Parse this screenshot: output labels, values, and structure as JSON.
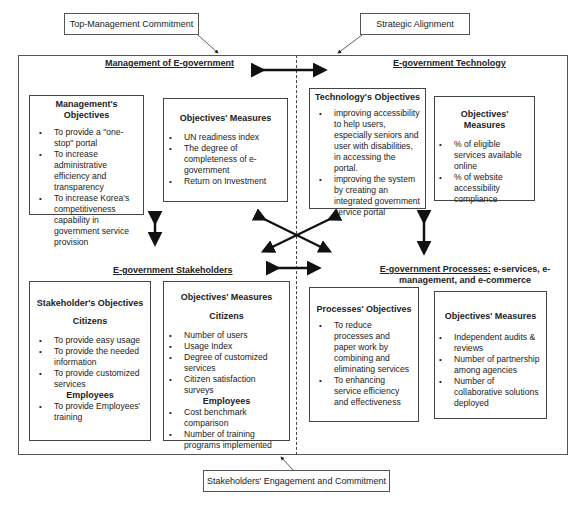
{
  "callouts": {
    "top_left": "Top-Management Commitment",
    "top_right": "Strategic Alignment",
    "bottom": "Stakeholders' Engagement and Commitment"
  },
  "quadrants": {
    "management": {
      "title": "Management of E-government",
      "objectives": {
        "heading": "Management's Objectives",
        "items": [
          "To provide a \"one-stop\" portal",
          "To increase administrative efficiency and transparency",
          "To increase Korea's competitiveness capability in government service provision"
        ]
      },
      "measures": {
        "heading": "Objectives' Measures",
        "items": [
          "UN readiness index",
          "The degree of completeness of e-government",
          "Return on Investment"
        ]
      }
    },
    "technology": {
      "title": "E-government Technology",
      "objectives": {
        "heading": "Technology's  Objectives",
        "items": [
          "improving accessibility to help users, especially seniors and user with disabilities, in accessing the portal.",
          "improving the system by creating an integrated government service portal"
        ]
      },
      "measures": {
        "heading": "Objectives' Measures",
        "items": [
          "% of eligible services available online",
          "% of website accessibility compliance"
        ]
      }
    },
    "stakeholders": {
      "title": "E-government Stakeholders",
      "objectives": {
        "heading": "Stakeholder's Objectives",
        "citizens_label": "Citizens",
        "citizens_items": [
          "To provide  easy usage",
          "To provide the  needed information",
          "To provide customized services"
        ],
        "employees_label": "Employees",
        "employees_items": [
          "To provide  Employees' training"
        ]
      },
      "measures": {
        "heading": "Objectives' Measures",
        "citizens_label": "Citizens",
        "citizens_items": [
          "Number of users",
          "Usage Index",
          "Degree of customized services",
          "Citizen satisfaction surveys"
        ],
        "employees_label": "Employees",
        "employees_items": [
          "Cost benchmark comparison",
          "Number of training programs implemented"
        ]
      }
    },
    "processes": {
      "title_underlined": "E-government Processes:",
      "title_rest": " e-services, e-",
      "title_line2": "management, and e-commerce",
      "objectives": {
        "heading": "Processes'  Objectives",
        "items": [
          "To reduce processes and paper work by combining and eliminating services",
          "To enhancing service efficiency and effectiveness"
        ]
      },
      "measures": {
        "heading": "Objectives' Measures",
        "items": [
          "Independent audits & reviews",
          "Number of partnership among agencies",
          "Number of collaborative solutions deployed"
        ]
      }
    }
  }
}
